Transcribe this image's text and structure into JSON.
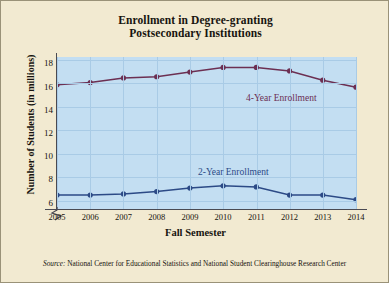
{
  "title": {
    "line1": "Enrollment in Degree-granting",
    "line2": "Postsecondary Institutions"
  },
  "source": {
    "label": "Source:",
    "text": " National Center for Educational Statistics and National Student Clearinghouse Research Center"
  },
  "colors": {
    "plot_background": "#c3def2",
    "page_background": "#f2ead1",
    "gridline": "#a9cbe6",
    "axis": "#4a4a52",
    "series_4year": "#6c2f52",
    "series_2year": "#2c4a86"
  },
  "chart_data": {
    "type": "line",
    "title": "Enrollment in Degree-granting Postsecondary Institutions",
    "xlabel": "Fall Semester",
    "ylabel": "Number of Students (in millions)",
    "x": [
      2005,
      2006,
      2007,
      2008,
      2009,
      2010,
      2011,
      2012,
      2013,
      2014
    ],
    "xticklabels": [
      "2005",
      "2006",
      "2007",
      "2008",
      "2009",
      "2010",
      "2011",
      "2012",
      "2013",
      "2014"
    ],
    "yticks": [
      6,
      8,
      10,
      12,
      14,
      16,
      18
    ],
    "yticklabels": [
      "6",
      "8",
      "10",
      "12",
      "14",
      "16",
      "18"
    ],
    "ylim": [
      5.5,
      18.6
    ],
    "xlim": [
      2005,
      2014
    ],
    "axis_break": true,
    "grid": true,
    "legend": "inline-labels",
    "series": [
      {
        "name": "4-Year Enrollment",
        "color": "#6c2f52",
        "values": [
          16.2,
          16.4,
          16.8,
          16.9,
          17.3,
          17.7,
          17.7,
          17.4,
          16.6,
          16.0
        ]
      },
      {
        "name": "2-Year Enrollment",
        "color": "#2c4a86",
        "values": [
          6.7,
          6.7,
          6.8,
          7.0,
          7.3,
          7.5,
          7.4,
          6.7,
          6.7,
          6.3
        ]
      }
    ],
    "annotations": [
      {
        "text": "4-Year Enrollment",
        "color": "#6c2f52"
      },
      {
        "text": "2-Year Enrollment",
        "color": "#2c4a86"
      }
    ]
  }
}
